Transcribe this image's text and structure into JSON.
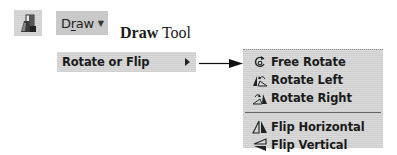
{
  "toolbar": {
    "draw_icon": "draw-shapes-icon",
    "draw_button": {
      "label_prefix": "D",
      "label_underlined": "r",
      "label_suffix": "aw",
      "caret_icon": "▼"
    }
  },
  "caption": {
    "bold": "Draw",
    "regular": " Tool"
  },
  "menu": {
    "item": {
      "label": "Rotate or Flip",
      "submenu_arrow_icon": "submenu-arrow-icon"
    }
  },
  "submenu": {
    "items": [
      {
        "label": "Free Rotate",
        "icon": "free-rotate-icon"
      },
      {
        "label": "Rotate Left",
        "icon": "rotate-left-icon"
      },
      {
        "label": "Rotate Right",
        "icon": "rotate-right-icon"
      },
      {
        "label": "Flip Horizontal",
        "icon": "flip-horizontal-icon"
      },
      {
        "label": "Flip Vertical",
        "icon": "flip-vertical-icon"
      }
    ]
  },
  "colors": {
    "menu_bg": "#d6d6d6",
    "button_bg": "#c9c9c9",
    "text": "#1a1a1a"
  }
}
